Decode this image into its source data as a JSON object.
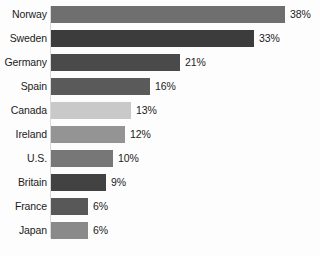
{
  "chart_data": {
    "type": "bar",
    "orientation": "horizontal",
    "title": "",
    "subtitle": "",
    "xlabel": "",
    "ylabel": "",
    "xlim": [
      0,
      38
    ],
    "grid": false,
    "legend": false,
    "value_suffix": "%",
    "categories": [
      "Norway",
      "Sweden",
      "Germany",
      "Spain",
      "Canada",
      "Ireland",
      "U.S.",
      "Britain",
      "France",
      "Japan"
    ],
    "values": [
      38,
      33,
      21,
      16,
      13,
      12,
      10,
      9,
      6,
      6
    ],
    "value_labels": [
      "38%",
      "33%",
      "21%",
      "16%",
      "13%",
      "12%",
      "10%",
      "9%",
      "6%",
      "6%"
    ],
    "bar_colors": [
      "#6f6f6f",
      "#3c3c3c",
      "#4a4a4a",
      "#5a5a5a",
      "#c9c9c9",
      "#949494",
      "#777777",
      "#424242",
      "#585858",
      "#8a8a8a"
    ]
  },
  "rows": [
    {
      "label": "Norway",
      "value_label": "38%",
      "value": 38,
      "color": "#6f6f6f",
      "clipped": false
    },
    {
      "label": "Sweden",
      "value_label": "33%",
      "value": 33,
      "color": "#3c3c3c",
      "clipped": false
    },
    {
      "label": "Germany",
      "value_label": "21%",
      "value": 21,
      "color": "#4a4a4a",
      "clipped": true
    },
    {
      "label": "Spain",
      "value_label": "16%",
      "value": 16,
      "color": "#5a5a5a",
      "clipped": false
    },
    {
      "label": "Canada",
      "value_label": "13%",
      "value": 13,
      "color": "#c9c9c9",
      "clipped": false
    },
    {
      "label": "Ireland",
      "value_label": "12%",
      "value": 12,
      "color": "#949494",
      "clipped": false
    },
    {
      "label": "U.S.",
      "value_label": "10%",
      "value": 10,
      "color": "#777777",
      "clipped": false
    },
    {
      "label": "Britain",
      "value_label": "9%",
      "value": 9,
      "color": "#424242",
      "clipped": false
    },
    {
      "label": "France",
      "value_label": "6%",
      "value": 6,
      "color": "#585858",
      "clipped": false
    },
    {
      "label": "Japan",
      "value_label": "6%",
      "value": 6,
      "color": "#8a8a8a",
      "clipped": false
    }
  ],
  "scale": {
    "max_value": 38,
    "max_bar_px": 234
  }
}
